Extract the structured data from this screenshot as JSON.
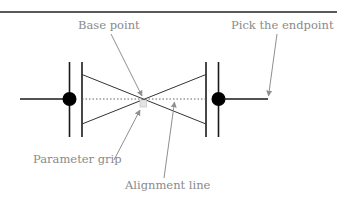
{
  "diagram": {
    "colors": {
      "line": "#1a1a1a",
      "callout": "#8f8f8f",
      "label": "#8a8a8a",
      "grip_fill": "#e4e4e4",
      "dotted": "#555555"
    },
    "labels": {
      "base_point": "Base point",
      "pick_endpoint": "Pick the endpoint",
      "parameter_grip": "Parameter grip",
      "alignment_line": "Alignment line"
    }
  }
}
